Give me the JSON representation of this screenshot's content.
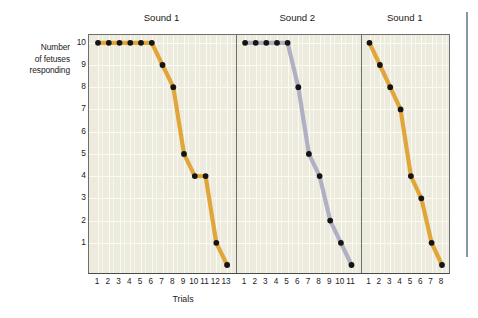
{
  "chart_data": {
    "type": "line",
    "title": "",
    "xlabel": "Trials",
    "ylabel": "Number of fetuses responding",
    "ylim": [
      0,
      10
    ],
    "yticks": [
      1,
      2,
      3,
      4,
      5,
      6,
      7,
      8,
      9,
      10
    ],
    "grid": true,
    "legend": "none",
    "panels": [
      {
        "title": "Sound 1",
        "color": "#e0a63a",
        "xlabel_ticks": [
          "1",
          "2",
          "3",
          "4",
          "5",
          "6",
          "7",
          "8",
          "9",
          "10",
          "11",
          "12",
          "13"
        ],
        "x": [
          1,
          2,
          3,
          4,
          5,
          6,
          7,
          8,
          9,
          10,
          11,
          12,
          13
        ],
        "values": [
          10,
          10,
          10,
          10,
          10,
          10,
          9,
          8,
          5,
          4,
          4,
          1,
          0
        ]
      },
      {
        "title": "Sound 2",
        "color": "#b0b0c4",
        "xlabel_ticks": [
          "1",
          "2",
          "3",
          "4",
          "5",
          "6",
          "7",
          "8",
          "9",
          "10",
          "11"
        ],
        "x": [
          1,
          2,
          3,
          4,
          5,
          6,
          7,
          8,
          9,
          10,
          11
        ],
        "values": [
          10,
          10,
          10,
          10,
          10,
          8,
          5,
          4,
          2,
          1,
          0
        ]
      },
      {
        "title": "Sound 1",
        "color": "#e0a63a",
        "xlabel_ticks": [
          "1",
          "2",
          "3",
          "4",
          "5",
          "6",
          "7",
          "8"
        ],
        "x": [
          1,
          2,
          3,
          4,
          5,
          6,
          7,
          8
        ],
        "values": [
          10,
          9,
          8,
          7,
          4,
          3,
          1,
          0
        ]
      }
    ]
  },
  "axis": {
    "y_title_lines": [
      "Number",
      "of fetuses",
      "responding"
    ],
    "x_title": "Trials",
    "y_tick_labels": [
      "10",
      "9",
      "8",
      "7",
      "6",
      "5",
      "4",
      "3",
      "2",
      "1"
    ]
  },
  "style": {
    "plot_background": "#edeade",
    "gridline_color": "#fbfbf4",
    "frame_color": "#6e6e6e",
    "marker_color": "#141414",
    "series_orange": "#e0a63a",
    "series_lavender": "#b0b0c4",
    "right_rule_color": "#8a96a8",
    "page_background": "#ffffff"
  }
}
